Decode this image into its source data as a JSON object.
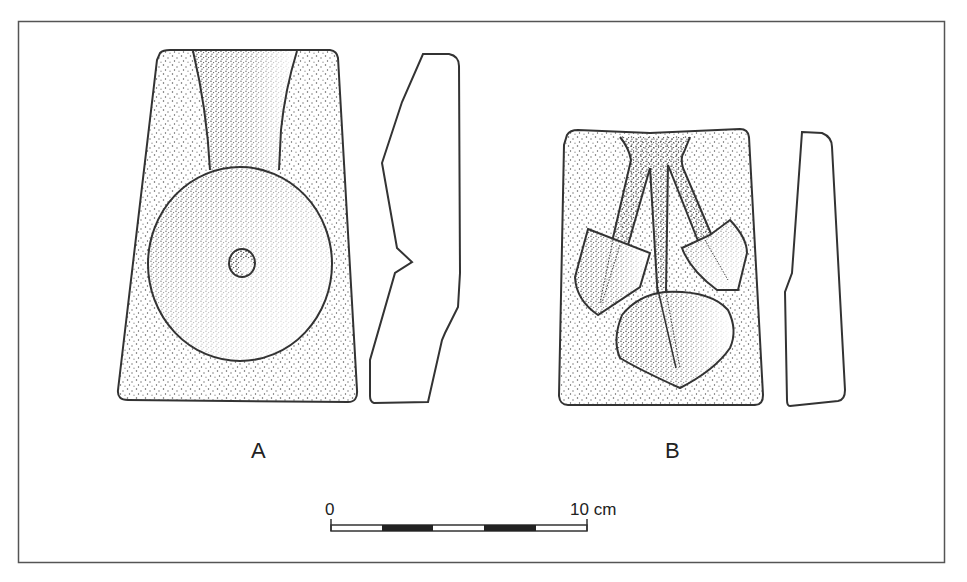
{
  "figure": {
    "type": "archaeological drawing of stone casting molds",
    "objects": [
      {
        "id": "A",
        "label": "A",
        "description": "mold with circular disc cavity, central hole and funnel channel; side profile to the right"
      },
      {
        "id": "B",
        "label": "B",
        "description": "mold with three branching channels ending in two spade-shaped and one leaf-shaped cavity; side profile to the right"
      }
    ],
    "scale_bar": {
      "start_label": "0",
      "end_label": "10 cm",
      "segments": 5
    }
  },
  "colors": {
    "line": "#333333",
    "frame": "#555555",
    "stipple": "#444444",
    "background": "#ffffff"
  }
}
